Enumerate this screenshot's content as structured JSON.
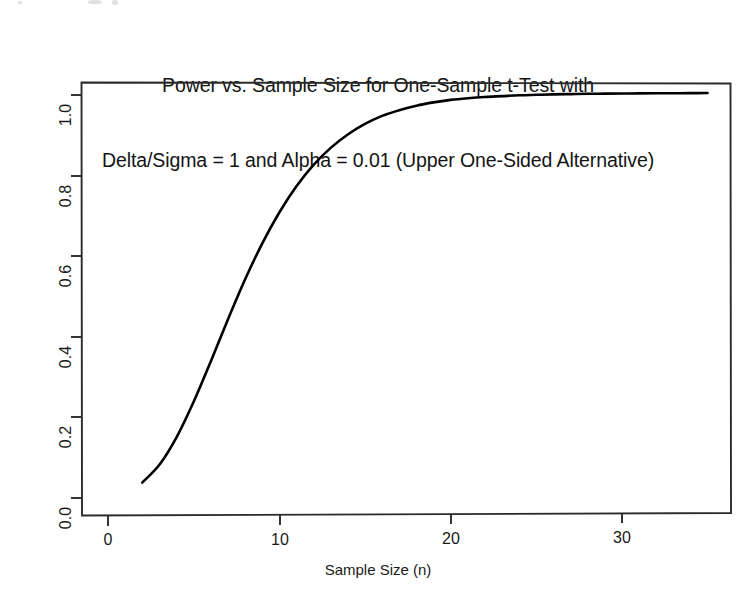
{
  "chart_data": {
    "type": "line",
    "title": "Power vs. Sample Size for One-Sample t-Test with Delta/Sigma = 1 and Alpha = 0.01 (Upper One-Sided Alternative)",
    "title_line_1": "Power vs. Sample Size for One-Sample t-Test with",
    "title_line_2": "Delta/Sigma = 1 and Alpha = 0.01 (Upper One-Sided Alternative)",
    "xlabel": "Sample Size (n)",
    "ylabel": "Power",
    "xlim": [
      -0.5,
      36.3
    ],
    "ylim": [
      -0.022,
      1.03
    ],
    "xticks": [
      0,
      10,
      20,
      30
    ],
    "xtick_labels": [
      "0",
      "10",
      "20",
      "30"
    ],
    "yticks": [
      0.0,
      0.2,
      0.4,
      0.6,
      0.8,
      1.0
    ],
    "ytick_labels": [
      "0.0",
      "0.2",
      "0.4",
      "0.6",
      "0.8",
      "1.0"
    ],
    "grid": false,
    "legend": false,
    "line_color": "#000000",
    "line_width": 2.6,
    "series": [
      {
        "name": "Power",
        "x": [
          2,
          3,
          4,
          5,
          6,
          7,
          8,
          9,
          10,
          11,
          12,
          13,
          14,
          15,
          16,
          17,
          18,
          19,
          20,
          21,
          22,
          23,
          24,
          25,
          26,
          27,
          28,
          29,
          30,
          31,
          32,
          33,
          34,
          35
        ],
        "y": [
          0.038,
          0.082,
          0.15,
          0.238,
          0.338,
          0.442,
          0.541,
          0.63,
          0.707,
          0.772,
          0.825,
          0.867,
          0.9,
          0.926,
          0.946,
          0.96,
          0.971,
          0.979,
          0.985,
          0.989,
          0.992,
          0.994,
          0.996,
          0.997,
          0.998,
          0.9985,
          0.999,
          0.9993,
          0.9995,
          0.9997,
          0.9998,
          0.9998,
          0.9999,
          0.9999
        ]
      }
    ],
    "annotations": []
  },
  "axis": {
    "y_tick_labels": [
      "1.0",
      "0.8",
      "0.6",
      "0.4",
      "0.2",
      "0.0"
    ],
    "x_tick_labels": [
      "0",
      "10",
      "20",
      "30"
    ],
    "y_axis_title": "Power",
    "x_axis_title": "Sample Size (n)"
  }
}
